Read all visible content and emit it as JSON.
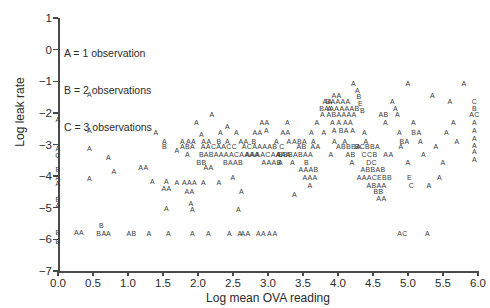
{
  "chart_data": {
    "type": "scatter",
    "title": "",
    "xlabel": "Log mean OVA reading",
    "ylabel": "Log leak rate",
    "xlim": [
      0.0,
      6.0
    ],
    "ylim": [
      -7,
      1
    ],
    "xticks": [
      "0.0",
      "0.5",
      "1.0",
      "1.5",
      "2.0",
      "2.5",
      "3.0",
      "3.5",
      "4.0",
      "4.5",
      "5.0",
      "5.5",
      "6.0"
    ],
    "yticks": [
      "1",
      "0",
      "-1",
      "-2",
      "-3",
      "-4",
      "-5",
      "-6",
      "-7"
    ],
    "grid": false,
    "legend_position": "upper-left-inside",
    "encoding_note": "Data points are drawn as letters; letter denotes number of overlapping observations at that location.",
    "legend": [
      "A = 1 observation",
      "B = 2 observations",
      "C = 3 observations"
    ],
    "markers": [
      {
        "x": 0.0,
        "y": -2.18,
        "label": "A"
      },
      {
        "x": 0.0,
        "y": -3.12,
        "label": "A"
      },
      {
        "x": 0.0,
        "y": -3.33,
        "label": "C"
      },
      {
        "x": 0.0,
        "y": -3.78,
        "label": "B"
      },
      {
        "x": 0.0,
        "y": -4.02,
        "label": "A"
      },
      {
        "x": 0.0,
        "y": -4.22,
        "label": "A"
      },
      {
        "x": 0.0,
        "y": -4.72,
        "label": "B"
      },
      {
        "x": 0.0,
        "y": -4.92,
        "label": "A"
      },
      {
        "x": 0.0,
        "y": -5.78,
        "label": "B"
      },
      {
        "x": 0.0,
        "y": -6.05,
        "label": "B"
      },
      {
        "x": 0.3,
        "y": -5.78,
        "label": "AA"
      },
      {
        "x": 0.45,
        "y": -1.4,
        "label": "A"
      },
      {
        "x": 0.45,
        "y": -2.55,
        "label": "A"
      },
      {
        "x": 0.45,
        "y": -3.12,
        "label": "A"
      },
      {
        "x": 0.45,
        "y": -4.05,
        "label": "A"
      },
      {
        "x": 0.62,
        "y": -5.55,
        "label": "B"
      },
      {
        "x": 0.62,
        "y": -5.8,
        "label": "BA"
      },
      {
        "x": 0.72,
        "y": -5.8,
        "label": "A"
      },
      {
        "x": 0.72,
        "y": -3.38,
        "label": "A"
      },
      {
        "x": 0.8,
        "y": -3.85,
        "label": "A"
      },
      {
        "x": 1.05,
        "y": -5.8,
        "label": "AB"
      },
      {
        "x": 1.22,
        "y": -3.72,
        "label": "AA"
      },
      {
        "x": 1.3,
        "y": -5.8,
        "label": "A"
      },
      {
        "x": 1.35,
        "y": -4.15,
        "label": "A"
      },
      {
        "x": 1.52,
        "y": -2.88,
        "label": "A"
      },
      {
        "x": 1.52,
        "y": -3.05,
        "label": "B"
      },
      {
        "x": 1.55,
        "y": -4.15,
        "label": "A"
      },
      {
        "x": 1.55,
        "y": -4.38,
        "label": "AA"
      },
      {
        "x": 1.55,
        "y": -5.02,
        "label": "A"
      },
      {
        "x": 1.58,
        "y": -5.8,
        "label": "A"
      },
      {
        "x": 1.4,
        "y": -2.62,
        "label": "A"
      },
      {
        "x": 1.7,
        "y": -3.18,
        "label": "A"
      },
      {
        "x": 1.7,
        "y": -4.18,
        "label": "A"
      },
      {
        "x": 1.78,
        "y": -2.88,
        "label": "A"
      },
      {
        "x": 1.85,
        "y": -3.05,
        "label": "ABA"
      },
      {
        "x": 1.85,
        "y": -3.3,
        "label": "A"
      },
      {
        "x": 1.88,
        "y": -4.18,
        "label": "AAA"
      },
      {
        "x": 1.88,
        "y": -4.48,
        "label": "AA"
      },
      {
        "x": 1.9,
        "y": -2.88,
        "label": "AA"
      },
      {
        "x": 1.9,
        "y": -4.85,
        "label": "A"
      },
      {
        "x": 1.92,
        "y": -5.05,
        "label": "A"
      },
      {
        "x": 1.92,
        "y": -5.8,
        "label": "A"
      },
      {
        "x": 1.98,
        "y": -2.3,
        "label": "A"
      },
      {
        "x": 2.05,
        "y": -2.68,
        "label": "A"
      },
      {
        "x": 2.05,
        "y": -3.3,
        "label": "B"
      },
      {
        "x": 2.05,
        "y": -3.55,
        "label": "BB"
      },
      {
        "x": 2.08,
        "y": -4.18,
        "label": "A"
      },
      {
        "x": 2.12,
        "y": -2.88,
        "label": "AA"
      },
      {
        "x": 2.15,
        "y": -3.72,
        "label": "AA"
      },
      {
        "x": 2.15,
        "y": -5.8,
        "label": "A"
      },
      {
        "x": 2.2,
        "y": -2.05,
        "label": "A"
      },
      {
        "x": 2.3,
        "y": -2.88,
        "label": "B"
      },
      {
        "x": 2.3,
        "y": -3.05,
        "label": "AACAACC"
      },
      {
        "x": 2.3,
        "y": -4.18,
        "label": "A"
      },
      {
        "x": 2.32,
        "y": -2.62,
        "label": "A"
      },
      {
        "x": 2.42,
        "y": -2.4,
        "label": "A"
      },
      {
        "x": 2.42,
        "y": -2.88,
        "label": "A"
      },
      {
        "x": 2.45,
        "y": -5.8,
        "label": "A"
      },
      {
        "x": 2.48,
        "y": -3.3,
        "label": "ABAAAACAAAA"
      },
      {
        "x": 2.5,
        "y": -3.55,
        "label": "BAAB"
      },
      {
        "x": 2.5,
        "y": -4.02,
        "label": "A"
      },
      {
        "x": 2.55,
        "y": -2.62,
        "label": "A"
      },
      {
        "x": 2.58,
        "y": -5.05,
        "label": "A"
      },
      {
        "x": 2.6,
        "y": -5.8,
        "label": "A"
      },
      {
        "x": 2.62,
        "y": -4.48,
        "label": "A"
      },
      {
        "x": 2.65,
        "y": -2.88,
        "label": "AA"
      },
      {
        "x": 2.68,
        "y": -5.8,
        "label": "AA"
      },
      {
        "x": 2.8,
        "y": -2.88,
        "label": "B"
      },
      {
        "x": 2.85,
        "y": -2.62,
        "label": "AA"
      },
      {
        "x": 2.88,
        "y": -3.05,
        "label": "ACAAAAB"
      },
      {
        "x": 2.9,
        "y": -5.8,
        "label": "AA"
      },
      {
        "x": 2.95,
        "y": -2.3,
        "label": "AA"
      },
      {
        "x": 2.98,
        "y": -2.55,
        "label": "A"
      },
      {
        "x": 3.0,
        "y": -3.3,
        "label": "AAAACAAAA"
      },
      {
        "x": 3.02,
        "y": -5.8,
        "label": "A"
      },
      {
        "x": 3.05,
        "y": -3.55,
        "label": "AAAB"
      },
      {
        "x": 3.1,
        "y": -5.8,
        "label": "A"
      },
      {
        "x": 3.12,
        "y": -2.88,
        "label": "A"
      },
      {
        "x": 3.15,
        "y": -3.3,
        "label": "A"
      },
      {
        "x": 3.18,
        "y": -3.55,
        "label": "A"
      },
      {
        "x": 3.2,
        "y": -3.05,
        "label": "C"
      },
      {
        "x": 3.25,
        "y": -2.62,
        "label": "AA"
      },
      {
        "x": 3.25,
        "y": -3.3,
        "label": "BBB"
      },
      {
        "x": 3.28,
        "y": -2.3,
        "label": "A"
      },
      {
        "x": 3.3,
        "y": -2.88,
        "label": "A"
      },
      {
        "x": 3.35,
        "y": -3.55,
        "label": "A"
      },
      {
        "x": 3.38,
        "y": -4.58,
        "label": "A"
      },
      {
        "x": 3.45,
        "y": -2.88,
        "label": "ABA"
      },
      {
        "x": 3.48,
        "y": -3.05,
        "label": "AB"
      },
      {
        "x": 3.5,
        "y": -3.3,
        "label": "ABAA"
      },
      {
        "x": 3.55,
        "y": -3.55,
        "label": "B"
      },
      {
        "x": 3.58,
        "y": -3.78,
        "label": "AAAB"
      },
      {
        "x": 3.6,
        "y": -4.02,
        "label": "AAA"
      },
      {
        "x": 3.6,
        "y": -4.28,
        "label": "A"
      },
      {
        "x": 3.62,
        "y": -2.62,
        "label": "A"
      },
      {
        "x": 3.65,
        "y": -2.88,
        "label": "A"
      },
      {
        "x": 3.68,
        "y": -3.05,
        "label": "AA"
      },
      {
        "x": 3.7,
        "y": -2.3,
        "label": "A"
      },
      {
        "x": 3.78,
        "y": -2.05,
        "label": "A"
      },
      {
        "x": 3.8,
        "y": -2.62,
        "label": "A"
      },
      {
        "x": 3.85,
        "y": -1.62,
        "label": "AA"
      },
      {
        "x": 3.88,
        "y": -1.85,
        "label": "A"
      },
      {
        "x": 3.9,
        "y": -3.3,
        "label": "A"
      },
      {
        "x": 3.95,
        "y": -2.88,
        "label": "A"
      },
      {
        "x": 3.98,
        "y": -1.42,
        "label": "AA"
      },
      {
        "x": 4.0,
        "y": -1.62,
        "label": "BAAAA"
      },
      {
        "x": 4.02,
        "y": -1.85,
        "label": "BAAAAAAB"
      },
      {
        "x": 4.05,
        "y": -2.05,
        "label": "ABAAAA"
      },
      {
        "x": 4.05,
        "y": -2.3,
        "label": "A A AA"
      },
      {
        "x": 4.08,
        "y": -2.55,
        "label": "A BA A"
      },
      {
        "x": 4.1,
        "y": -2.88,
        "label": "A"
      },
      {
        "x": 4.15,
        "y": -3.05,
        "label": "ABBBA"
      },
      {
        "x": 4.18,
        "y": -3.3,
        "label": "AB"
      },
      {
        "x": 4.2,
        "y": -3.55,
        "label": "A"
      },
      {
        "x": 4.22,
        "y": -1.05,
        "label": "A"
      },
      {
        "x": 4.28,
        "y": -1.28,
        "label": "A"
      },
      {
        "x": 4.3,
        "y": -1.48,
        "label": "B"
      },
      {
        "x": 4.32,
        "y": -1.7,
        "label": "E"
      },
      {
        "x": 4.35,
        "y": -1.9,
        "label": "B"
      },
      {
        "x": 4.38,
        "y": -2.62,
        "label": "A"
      },
      {
        "x": 4.4,
        "y": -2.88,
        "label": "A"
      },
      {
        "x": 4.42,
        "y": -3.05,
        "label": "BCBBA"
      },
      {
        "x": 4.45,
        "y": -3.3,
        "label": "CCB"
      },
      {
        "x": 4.48,
        "y": -3.55,
        "label": "DC"
      },
      {
        "x": 4.5,
        "y": -3.78,
        "label": "ABBAB"
      },
      {
        "x": 4.52,
        "y": -4.02,
        "label": "AAACEBB"
      },
      {
        "x": 4.55,
        "y": -4.28,
        "label": "ABAA"
      },
      {
        "x": 4.58,
        "y": -4.48,
        "label": "BB"
      },
      {
        "x": 4.62,
        "y": -4.68,
        "label": "AA"
      },
      {
        "x": 4.65,
        "y": -2.05,
        "label": "AB"
      },
      {
        "x": 4.68,
        "y": -2.3,
        "label": "A"
      },
      {
        "x": 4.72,
        "y": -3.3,
        "label": "AA"
      },
      {
        "x": 4.78,
        "y": -1.62,
        "label": "A"
      },
      {
        "x": 4.82,
        "y": -1.85,
        "label": "A"
      },
      {
        "x": 4.85,
        "y": -2.05,
        "label": "A"
      },
      {
        "x": 4.88,
        "y": -2.62,
        "label": "A"
      },
      {
        "x": 4.9,
        "y": -3.05,
        "label": "A"
      },
      {
        "x": 4.92,
        "y": -5.8,
        "label": "AC"
      },
      {
        "x": 4.95,
        "y": -2.88,
        "label": "BA"
      },
      {
        "x": 5.0,
        "y": -1.05,
        "label": "A"
      },
      {
        "x": 5.0,
        "y": -3.55,
        "label": "A"
      },
      {
        "x": 5.02,
        "y": -4.02,
        "label": "E"
      },
      {
        "x": 5.05,
        "y": -4.28,
        "label": "C"
      },
      {
        "x": 5.08,
        "y": -2.3,
        "label": "A"
      },
      {
        "x": 5.12,
        "y": -2.62,
        "label": "BA"
      },
      {
        "x": 5.18,
        "y": -2.88,
        "label": "A"
      },
      {
        "x": 5.22,
        "y": -3.3,
        "label": "A"
      },
      {
        "x": 5.28,
        "y": -5.8,
        "label": "A"
      },
      {
        "x": 5.3,
        "y": -4.28,
        "label": "A"
      },
      {
        "x": 5.35,
        "y": -1.42,
        "label": "A"
      },
      {
        "x": 5.4,
        "y": -3.05,
        "label": "A"
      },
      {
        "x": 5.45,
        "y": -4.02,
        "label": "A"
      },
      {
        "x": 5.5,
        "y": -3.55,
        "label": "A"
      },
      {
        "x": 5.55,
        "y": -2.62,
        "label": "A"
      },
      {
        "x": 5.6,
        "y": -1.62,
        "label": "A"
      },
      {
        "x": 5.65,
        "y": -2.3,
        "label": "A"
      },
      {
        "x": 5.7,
        "y": -2.88,
        "label": "A"
      },
      {
        "x": 5.8,
        "y": -1.05,
        "label": "A"
      },
      {
        "x": 5.95,
        "y": -1.62,
        "label": "C"
      },
      {
        "x": 5.95,
        "y": -1.85,
        "label": "B"
      },
      {
        "x": 5.95,
        "y": -2.05,
        "label": "AC"
      },
      {
        "x": 5.95,
        "y": -2.3,
        "label": "A"
      },
      {
        "x": 5.95,
        "y": -2.55,
        "label": "A"
      },
      {
        "x": 5.95,
        "y": -2.78,
        "label": "A"
      },
      {
        "x": 5.95,
        "y": -3.0,
        "label": "A"
      },
      {
        "x": 5.95,
        "y": -3.22,
        "label": "A"
      },
      {
        "x": 5.95,
        "y": -3.45,
        "label": "A"
      }
    ]
  }
}
